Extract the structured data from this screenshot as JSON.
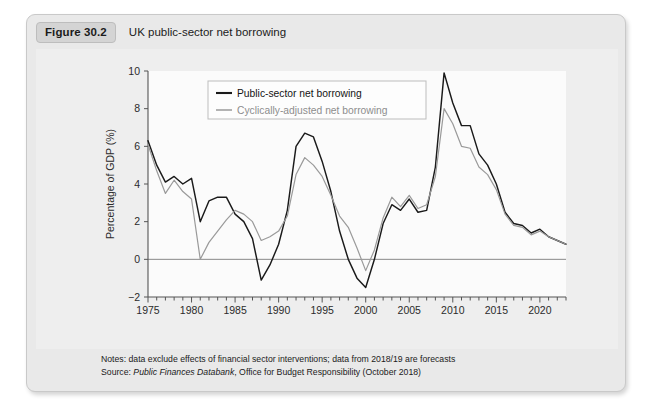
{
  "figure": {
    "badge": "Figure 30.2",
    "caption": "UK public-sector net borrowing"
  },
  "footer": {
    "notes": "Notes: data exclude effects of financial sector interventions; data from 2018/19 are forecasts",
    "source_prefix": "Source: ",
    "source_italic": "Public Finances Databank",
    "source_rest": ", Office for Budget Responsibility (October 2018)"
  },
  "colors": {
    "series_primary": "#1a1a1a",
    "series_secondary": "#9a9a9a",
    "axis": "#555555",
    "zero_line": "#888888",
    "plot_background": "#fbfbfb",
    "card_background": "#e9e9e9",
    "panel_background": "#eeeeee"
  },
  "chart_data": {
    "type": "line",
    "title": "UK public-sector net borrowing",
    "xlabel": "",
    "ylabel": "Percentage of GDP (%)",
    "xlim": [
      1975,
      2023
    ],
    "ylim": [
      -2,
      10
    ],
    "yticks": [
      -2,
      0,
      2,
      4,
      6,
      8,
      10
    ],
    "xticks": [
      1975,
      1980,
      1985,
      1990,
      1995,
      2000,
      2005,
      2010,
      2015,
      2020
    ],
    "x_minor_tick_step": 1,
    "grid": false,
    "legend_position": "top-left",
    "zero_line": 0,
    "x": [
      1975,
      1976,
      1977,
      1978,
      1979,
      1980,
      1981,
      1982,
      1983,
      1984,
      1985,
      1986,
      1987,
      1988,
      1989,
      1990,
      1991,
      1992,
      1993,
      1994,
      1995,
      1996,
      1997,
      1998,
      1999,
      2000,
      2001,
      2002,
      2003,
      2004,
      2005,
      2006,
      2007,
      2008,
      2009,
      2010,
      2011,
      2012,
      2013,
      2014,
      2015,
      2016,
      2017,
      2018,
      2019,
      2020,
      2021,
      2022,
      2023
    ],
    "series": [
      {
        "name": "Public-sector net borrowing",
        "color": "#1a1a1a",
        "values": [
          6.3,
          5.0,
          4.1,
          4.4,
          4.0,
          4.3,
          2.0,
          3.1,
          3.3,
          3.3,
          2.4,
          2.0,
          1.1,
          -1.1,
          -0.3,
          0.8,
          2.6,
          6.0,
          6.7,
          6.5,
          5.2,
          3.6,
          1.5,
          0.0,
          -1.0,
          -1.5,
          0.0,
          1.9,
          2.9,
          2.6,
          3.2,
          2.5,
          2.6,
          4.9,
          9.9,
          8.3,
          7.1,
          7.1,
          5.6,
          5.0,
          4.0,
          2.5,
          1.9,
          1.8,
          1.4,
          1.6,
          1.2,
          1.0,
          0.8
        ]
      },
      {
        "name": "Cyclically-adjusted net borrowing",
        "color": "#9a9a9a",
        "values": [
          6.1,
          4.7,
          3.5,
          4.2,
          3.6,
          3.2,
          0.0,
          0.9,
          1.5,
          2.1,
          2.6,
          2.4,
          2.0,
          1.0,
          1.2,
          1.5,
          2.3,
          4.5,
          5.4,
          5.0,
          4.4,
          3.4,
          2.3,
          1.7,
          0.6,
          -0.6,
          0.5,
          2.2,
          3.3,
          2.8,
          3.4,
          2.7,
          2.9,
          4.4,
          8.0,
          7.2,
          6.0,
          5.9,
          4.9,
          4.5,
          3.7,
          2.4,
          1.8,
          1.7,
          1.3,
          1.5,
          1.2,
          1.0,
          0.8
        ]
      }
    ],
    "legend": [
      "Public-sector net borrowing",
      "Cyclically-adjusted net borrowing"
    ]
  }
}
